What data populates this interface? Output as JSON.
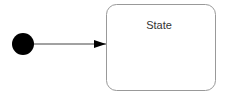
{
  "diagram": {
    "type": "uml-state-machine",
    "initial_state": {
      "shape": "filled-circle",
      "color": "#000000"
    },
    "transitions": [
      {
        "from": "initial",
        "to": "state",
        "label": ""
      }
    ],
    "states": [
      {
        "id": "state",
        "label": "State",
        "border_color": "#999999",
        "fill": "#ffffff"
      }
    ],
    "colors": {
      "line": "#444444",
      "arrowhead": "#000000",
      "text": "#333333"
    }
  }
}
